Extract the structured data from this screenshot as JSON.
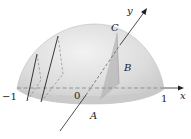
{
  "diagram": {
    "axes": {
      "x_label": "x",
      "y_label": "y",
      "ticks": {
        "neg_one": "−1",
        "zero": "0",
        "one": "1"
      }
    },
    "points": {
      "A": "A",
      "B": "B",
      "C": "C"
    },
    "colors": {
      "dome_fill": "#d9d9d9",
      "dome_highlight": "#efefef",
      "base_fill": "#c8c8c8",
      "cross_section": "#b8b8b8",
      "line": "#222222",
      "dashed": "#777777"
    }
  }
}
